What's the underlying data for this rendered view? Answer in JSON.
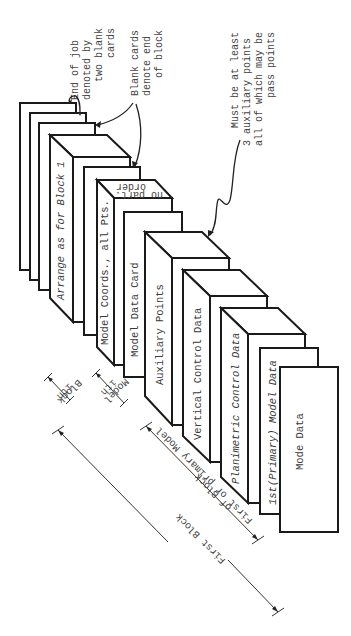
{
  "diagram": {
    "cards": [
      {
        "id": "end-blank-1",
        "label": "",
        "kind": "blank"
      },
      {
        "id": "end-blank-2",
        "label": "",
        "kind": "blank"
      },
      {
        "id": "block-end-blank",
        "label": "",
        "kind": "blank"
      },
      {
        "id": "arrange-block",
        "label": "Arrange as for Block 1",
        "kind": "block"
      },
      {
        "id": "model-end-blank",
        "label": "",
        "kind": "blank"
      },
      {
        "id": "model-coords",
        "label": "Model Coords., all Pts.",
        "top_label_1": "no part.",
        "top_label_2": "order",
        "kind": "block"
      },
      {
        "id": "model-data-card",
        "label": "Model Data Card",
        "kind": "card"
      },
      {
        "id": "auxiliary-points",
        "label": "Auxiliary Points",
        "kind": "block"
      },
      {
        "id": "vertical-control",
        "label": "Vertical Control Data",
        "kind": "block"
      },
      {
        "id": "planimetric-control",
        "label": "Planimetric Control Data",
        "kind": "block"
      },
      {
        "id": "primary-model-data",
        "label": "1st(Primary) Model Data",
        "kind": "card"
      },
      {
        "id": "mode-data",
        "label": "Mode Data",
        "kind": "card"
      }
    ],
    "annotations": {
      "end_of_job": [
        "End of job",
        "denoted by",
        "two blank",
        "cards"
      ],
      "blank_cards": [
        "Blank cards",
        "denote  end",
        "of block"
      ],
      "auxiliary_note": [
        "Must be at least",
        "3 auxiliary  points",
        "all of which may be",
        "pass points"
      ]
    },
    "dimensions": {
      "ith_block": [
        "ith",
        "Block"
      ],
      "ith_model": [
        "ith",
        "Model"
      ],
      "first_model": [
        "First or primary Model",
        "of Block"
      ],
      "first_block": "First Block"
    }
  }
}
